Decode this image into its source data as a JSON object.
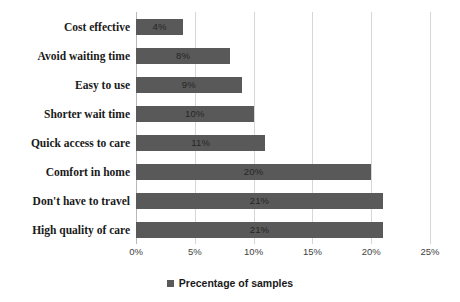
{
  "chart_data": {
    "type": "bar",
    "orientation": "horizontal",
    "title": "",
    "xlabel": "",
    "ylabel": "",
    "categories": [
      "Cost effective",
      "Avoid waiting time",
      "Easy to use",
      "Shorter wait time",
      "Quick access to care",
      "Comfort in home",
      "Don't have to travel",
      "High quality of care"
    ],
    "values": [
      4,
      8,
      9,
      10,
      11,
      20,
      21,
      21
    ],
    "value_labels": [
      "4%",
      "8%",
      "9%",
      "10%",
      "11%",
      "20%",
      "21%",
      "21%"
    ],
    "series": [
      {
        "name": "Precentage of samples",
        "values": [
          4,
          8,
          9,
          10,
          11,
          20,
          21,
          21
        ]
      }
    ],
    "xlim": [
      0,
      25
    ],
    "x_ticks": [
      0,
      5,
      10,
      15,
      20,
      25
    ],
    "x_tick_labels": [
      "0%",
      "5%",
      "10%",
      "15%",
      "20%",
      "25%"
    ],
    "grid": true,
    "grid_axis": "x",
    "legend_position": "bottom",
    "legend_entries": [
      "Precentage of samples"
    ],
    "colors": {
      "bar": "#595959",
      "gridline": "#d6d6d6",
      "axis": "#b8b8b8",
      "label_text": "#1a1a1a",
      "tick_text": "#3f3f3f",
      "value_text": "#262626",
      "background": "#ffffff"
    }
  },
  "legend": {
    "label": "Precentage of samples",
    "marker": "legend-square-marker"
  }
}
